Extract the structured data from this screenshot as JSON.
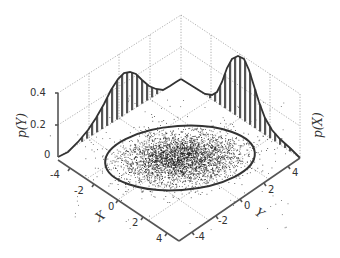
{
  "chart_data": {
    "type": "scatter",
    "title": "",
    "axes": {
      "x": {
        "label": "X",
        "ticks": [
          "-4",
          "-2",
          "0",
          "2",
          "4"
        ],
        "range": [
          -4,
          4
        ]
      },
      "y": {
        "label": "Y",
        "ticks": [
          "-4",
          "-2",
          "0",
          "2",
          "4"
        ],
        "range": [
          -4,
          4
        ]
      },
      "z_left": {
        "label": "p(Y)",
        "ticks": [
          "0",
          "0.2",
          "0.4"
        ],
        "range": [
          0,
          0.4
        ]
      },
      "z_right": {
        "label": "p(X)",
        "ticks": [],
        "range": [
          0,
          0.4
        ]
      }
    },
    "series": [
      {
        "name": "samples",
        "type": "scatter",
        "count_estimate": 5000,
        "center": [
          0,
          0
        ],
        "correlation": "positive"
      },
      {
        "name": "confidence-ellipse",
        "type": "ellipse"
      },
      {
        "name": "p(Y)",
        "type": "histogram+curve",
        "peak_value": 0.35,
        "shape": "skewed unimodal"
      },
      {
        "name": "p(X)",
        "type": "histogram+curve",
        "peak_value": 0.4,
        "shape": "skewed unimodal"
      }
    ],
    "grid": true
  },
  "labels": {
    "pY": "p(Y)",
    "pX": "p(X)",
    "x_axis": "X",
    "y_axis": "Y",
    "z_ticks": [
      "0.4",
      "0.2",
      "0"
    ],
    "x_ticks": [
      "-4",
      "-2",
      "0",
      "2",
      "4"
    ],
    "y_ticks": [
      "-4",
      "-2",
      "0",
      "2",
      "4"
    ]
  }
}
